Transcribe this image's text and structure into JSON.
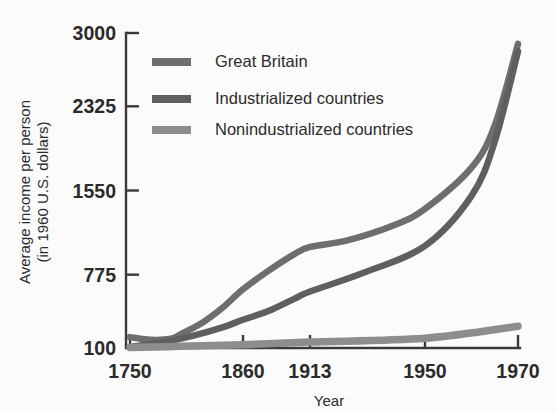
{
  "chart_data": {
    "type": "line",
    "title": "",
    "xlabel": "Year",
    "ylabel_line1": "Average income per person",
    "ylabel_line2": "(in 1960 U.S. dollars)",
    "grid": false,
    "legend_position": "top-left-inside",
    "x_ticks": [
      "1750",
      "1860",
      "1913",
      "1950",
      "1970"
    ],
    "x_tick_values": [
      1750,
      1860,
      1913,
      1950,
      1970
    ],
    "y_ticks": [
      "100",
      "775",
      "1550",
      "2325",
      "3000"
    ],
    "y_tick_values": [
      100,
      775,
      1550,
      2325,
      3000
    ],
    "ylim": [
      100,
      3000
    ],
    "xlim": [
      1750,
      1970
    ],
    "series": [
      {
        "name": "Great Britain",
        "color": "#6e6e6e",
        "x": [
          1750,
          1770,
          1790,
          1800,
          1820,
          1840,
          1860,
          1880,
          1900,
          1913,
          1925,
          1940,
          1950,
          1960,
          1965,
          1970
        ],
        "values": [
          200,
          175,
          185,
          230,
          330,
          470,
          640,
          810,
          960,
          1030,
          1090,
          1230,
          1380,
          1760,
          2150,
          2900
        ]
      },
      {
        "name": "Industrialized countries",
        "color": "#5f5f5f",
        "x": [
          1750,
          1780,
          1810,
          1840,
          1860,
          1880,
          1900,
          1913,
          1930,
          1950,
          1960,
          1965,
          1970
        ],
        "values": [
          110,
          150,
          210,
          290,
          360,
          440,
          550,
          620,
          790,
          1040,
          1500,
          2000,
          2830
        ]
      },
      {
        "name": "Nonindustrialized countries",
        "color": "#8d8d8d",
        "x": [
          1750,
          1800,
          1860,
          1913,
          1950,
          1970
        ],
        "values": [
          105,
          115,
          130,
          155,
          190,
          300
        ]
      }
    ]
  }
}
